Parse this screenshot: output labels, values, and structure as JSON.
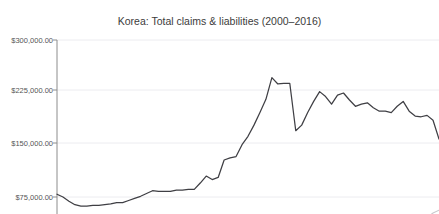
{
  "clipped_text": {
    "content": "····································"
  },
  "colors": {
    "series_primary": "#3f3f44",
    "series_secondary": "#c9c9cd",
    "gridline": "#ececf0",
    "axis": "#8c8c8c",
    "text": "#3c3c3c",
    "tick_text": "#555555",
    "background": "#ffffff"
  },
  "chart_data": {
    "type": "line",
    "title": "Korea: Total claims & liabilities (2000–2016)",
    "xlabel": "",
    "ylabel": "",
    "grid": true,
    "legend_position": "none",
    "ylim": [
      0,
      300000
    ],
    "xlim": [
      2000,
      2016
    ],
    "ytick_labels": [
      "$300,000.00",
      "$225,000.00",
      "$150,000.00",
      "$75,000.00"
    ],
    "ytick_values": [
      300000,
      225000,
      150000,
      75000
    ],
    "x": [
      2000.0,
      2000.25,
      2000.5,
      2000.75,
      2001.0,
      2001.25,
      2001.5,
      2001.75,
      2002.0,
      2002.25,
      2002.5,
      2002.75,
      2003.0,
      2003.25,
      2003.5,
      2003.75,
      2004.0,
      2004.25,
      2004.5,
      2004.75,
      2005.0,
      2005.25,
      2005.5,
      2005.75,
      2006.0,
      2006.25,
      2006.5,
      2006.75,
      2007.0,
      2007.25,
      2007.5,
      2007.75,
      2008.0,
      2008.25,
      2008.5,
      2008.75,
      2009.0,
      2009.25,
      2009.5,
      2009.75,
      2010.0,
      2010.25,
      2010.5,
      2010.75,
      2011.0,
      2011.25,
      2011.5,
      2011.75,
      2012.0,
      2012.25,
      2012.5,
      2012.75,
      2013.0,
      2013.25,
      2013.5,
      2013.75,
      2014.0,
      2014.25,
      2014.5,
      2014.75,
      2015.0,
      2015.25,
      2015.5,
      2015.75,
      2016.0
    ],
    "series": [
      {
        "name": "Total claims",
        "color": "#3f3f44",
        "values": [
          79000,
          75000,
          69000,
          64000,
          62000,
          62000,
          63000,
          63000,
          64000,
          65000,
          67000,
          67000,
          70000,
          73000,
          76000,
          80000,
          84000,
          83000,
          83000,
          83000,
          85000,
          85000,
          86000,
          86000,
          95000,
          105000,
          100000,
          103000,
          128000,
          131000,
          133000,
          150000,
          162000,
          178000,
          196000,
          215000,
          246000,
          237000,
          238000,
          238000,
          170000,
          178000,
          196000,
          212000,
          226000,
          219000,
          208000,
          221000,
          224000,
          214000,
          205000,
          208000,
          210000,
          203000,
          198000,
          198000,
          196000,
          205000,
          212000,
          198000,
          191000,
          190000,
          192000,
          185000,
          158000
        ]
      },
      {
        "name": "Total liabilities",
        "color": "#c9c9cd",
        "values": [
          null,
          null,
          null,
          null,
          null,
          null,
          null,
          null,
          null,
          null,
          null,
          null,
          null,
          null,
          null,
          null,
          null,
          null,
          null,
          null,
          null,
          null,
          null,
          null,
          null,
          null,
          null,
          null,
          null,
          null,
          null,
          null,
          null,
          null,
          null,
          null,
          null,
          null,
          null,
          null,
          null,
          null,
          null,
          null,
          null,
          null,
          null,
          null,
          null,
          null,
          null,
          null,
          null,
          null,
          null,
          null,
          null,
          null,
          28000,
          34000,
          40000,
          37000,
          46000,
          52000,
          56000
        ]
      }
    ],
    "note_cropped": "Chart is clipped at the bottom of the screenshot; the lower portion of the plot and the x-axis are not visible."
  }
}
